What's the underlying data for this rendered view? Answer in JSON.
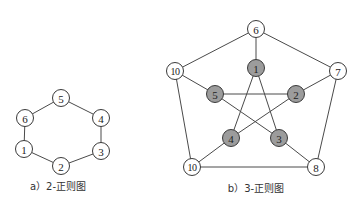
{
  "diagrams": {
    "a": {
      "caption": "a）2-正则图",
      "nodes": [
        {
          "id": "1",
          "label": "1",
          "x": 24,
          "y": 149,
          "fill": "white"
        },
        {
          "id": "2",
          "label": "2",
          "x": 61,
          "y": 166,
          "fill": "white"
        },
        {
          "id": "3",
          "label": "3",
          "x": 101,
          "y": 151,
          "fill": "white"
        },
        {
          "id": "4",
          "label": "4",
          "x": 101,
          "y": 118,
          "fill": "white"
        },
        {
          "id": "5",
          "label": "5",
          "x": 61,
          "y": 98,
          "fill": "white"
        },
        {
          "id": "6",
          "label": "6",
          "x": 25,
          "y": 118,
          "fill": "white"
        }
      ],
      "edges": [
        [
          "1",
          "2"
        ],
        [
          "2",
          "3"
        ],
        [
          "3",
          "4"
        ],
        [
          "4",
          "5"
        ],
        [
          "5",
          "6"
        ],
        [
          "6",
          "1"
        ]
      ]
    },
    "b": {
      "caption": "b）3-正则图",
      "nodes": [
        {
          "id": "6",
          "label": "6",
          "x": 256,
          "y": 29,
          "fill": "white"
        },
        {
          "id": "7",
          "label": "7",
          "x": 338,
          "y": 71,
          "fill": "white"
        },
        {
          "id": "8",
          "label": "8",
          "x": 316,
          "y": 167,
          "fill": "white"
        },
        {
          "id": "10b",
          "label": "10",
          "x": 192,
          "y": 167,
          "fill": "white"
        },
        {
          "id": "10a",
          "label": "10",
          "x": 175,
          "y": 71,
          "fill": "white"
        },
        {
          "id": "1",
          "label": "1",
          "x": 256,
          "y": 68,
          "fill": "gray"
        },
        {
          "id": "2",
          "label": "2",
          "x": 296,
          "y": 94,
          "fill": "gray"
        },
        {
          "id": "3",
          "label": "3",
          "x": 279,
          "y": 138,
          "fill": "gray"
        },
        {
          "id": "4",
          "label": "4",
          "x": 231,
          "y": 138,
          "fill": "gray"
        },
        {
          "id": "5",
          "label": "5",
          "x": 215,
          "y": 94,
          "fill": "gray"
        }
      ],
      "edges": [
        [
          "6",
          "7"
        ],
        [
          "7",
          "8"
        ],
        [
          "8",
          "10b"
        ],
        [
          "10b",
          "10a"
        ],
        [
          "10a",
          "6"
        ],
        [
          "6",
          "1"
        ],
        [
          "7",
          "2"
        ],
        [
          "8",
          "3"
        ],
        [
          "10b",
          "4"
        ],
        [
          "10a",
          "5"
        ],
        [
          "1",
          "4"
        ],
        [
          "1",
          "3"
        ],
        [
          "5",
          "2"
        ],
        [
          "5",
          "3"
        ],
        [
          "2",
          "4"
        ]
      ]
    }
  },
  "colors": {
    "gray_node": "#9c9c9c",
    "white_node": "#ffffff",
    "stroke": "#3a3a3a"
  }
}
